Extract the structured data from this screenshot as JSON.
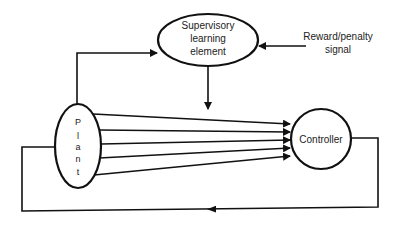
{
  "diagram": {
    "type": "block-diagram",
    "nodes": {
      "supervisory": {
        "line1": "Supervisory",
        "line2": "learning",
        "line3": "element"
      },
      "reward": {
        "line1": "Reward/penalty",
        "line2": "signal"
      },
      "plant": {
        "letters": [
          "P",
          "l",
          "a",
          "n",
          "t"
        ]
      },
      "controller": {
        "label": "Controller"
      }
    },
    "edges": [
      {
        "from": "plant",
        "to": "supervisory"
      },
      {
        "from": "reward",
        "to": "supervisory"
      },
      {
        "from": "supervisory",
        "to": "controller-inputs"
      },
      {
        "from": "plant",
        "to": "controller",
        "count": 5
      },
      {
        "from": "controller",
        "to": "plant",
        "kind": "feedback"
      }
    ],
    "colors": {
      "stroke": "#111111",
      "background": "#ffffff"
    }
  }
}
